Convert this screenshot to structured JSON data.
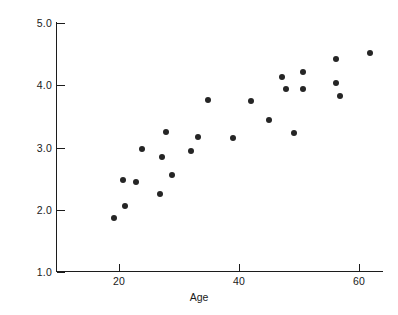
{
  "chart_data": {
    "type": "scatter",
    "title": "",
    "xlabel": "Age",
    "ylabel": "Cholesterol level",
    "xlim": [
      10.5,
      64.5
    ],
    "ylim": [
      1.0,
      5.25
    ],
    "xticks": [
      20,
      40,
      60
    ],
    "xtick_labels": [
      "20",
      "40",
      "60"
    ],
    "yticks": [
      1.0,
      2.0,
      3.0,
      4.0,
      5.0
    ],
    "ytick_labels": [
      "1.0",
      "2.0",
      "3.0",
      "4.0",
      "5.0"
    ],
    "grid": false,
    "legend": null,
    "marker_color": "#252525",
    "axis_color": "#1c1c1c",
    "background_color": "#ffffff",
    "n_points": 24,
    "x": [
      19.2,
      21.0,
      20.7,
      22.9,
      23.9,
      26.9,
      27.1,
      27.8,
      28.9,
      32.0,
      33.1,
      34.9,
      39.0,
      42.0,
      45.0,
      47.2,
      47.8,
      49.1,
      50.7,
      50.7,
      56.1,
      56.2,
      56.8,
      61.8
    ],
    "y": [
      1.87,
      2.06,
      2.47,
      2.45,
      2.97,
      2.25,
      2.85,
      3.25,
      2.56,
      2.95,
      3.17,
      3.77,
      3.15,
      3.75,
      3.44,
      4.13,
      3.95,
      3.23,
      4.22,
      3.95,
      4.43,
      4.04,
      3.83,
      4.53
    ],
    "points": [
      {
        "age": 19.2,
        "cholesterol": 1.87
      },
      {
        "age": 21.0,
        "cholesterol": 2.06
      },
      {
        "age": 20.7,
        "cholesterol": 2.47
      },
      {
        "age": 22.9,
        "cholesterol": 2.45
      },
      {
        "age": 23.9,
        "cholesterol": 2.97
      },
      {
        "age": 26.9,
        "cholesterol": 2.25
      },
      {
        "age": 27.1,
        "cholesterol": 2.85
      },
      {
        "age": 27.8,
        "cholesterol": 3.25
      },
      {
        "age": 28.9,
        "cholesterol": 2.56
      },
      {
        "age": 32.0,
        "cholesterol": 2.95
      },
      {
        "age": 33.1,
        "cholesterol": 3.17
      },
      {
        "age": 34.9,
        "cholesterol": 3.77
      },
      {
        "age": 39.0,
        "cholesterol": 3.15
      },
      {
        "age": 42.0,
        "cholesterol": 3.75
      },
      {
        "age": 45.0,
        "cholesterol": 3.44
      },
      {
        "age": 47.2,
        "cholesterol": 4.13
      },
      {
        "age": 47.8,
        "cholesterol": 3.95
      },
      {
        "age": 49.1,
        "cholesterol": 3.23
      },
      {
        "age": 50.7,
        "cholesterol": 4.22
      },
      {
        "age": 50.7,
        "cholesterol": 3.95
      },
      {
        "age": 56.1,
        "cholesterol": 4.43
      },
      {
        "age": 56.2,
        "cholesterol": 4.04
      },
      {
        "age": 56.8,
        "cholesterol": 3.83
      },
      {
        "age": 61.8,
        "cholesterol": 4.53
      }
    ]
  }
}
